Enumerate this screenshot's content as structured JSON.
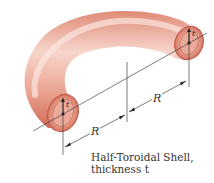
{
  "diagram": {
    "caption_line1": "Half-Toroidal Shell,",
    "caption_line2": "thickness t",
    "dimension_labels": {
      "left_radius": "R",
      "right_radius": "R",
      "left_thickness": "t",
      "right_thickness": "t"
    },
    "colors": {
      "shell_light": "#f6d2c8",
      "shell_mid": "#e8907c",
      "shell_dark": "#c9604c",
      "inner_cavity": "#e3a092",
      "lines": "#444444"
    }
  }
}
